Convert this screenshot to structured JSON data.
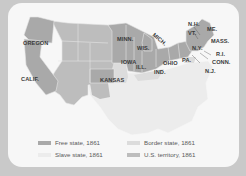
{
  "map": {
    "title": "United States, 1861",
    "labels": {
      "oregon": "OREGON",
      "calif": "CALIF.",
      "kansas": "KANSAS",
      "minn": "MINN.",
      "wis": "WIS.",
      "mich": "MICH.",
      "iowa": "IOWA",
      "ill": "ILL.",
      "ind": "IND.",
      "ohio": "OHIO",
      "pa": "PA.",
      "ny": "N.Y.",
      "nh": "N.H.",
      "vt": "VT.",
      "me": "ME.",
      "mass": "MASS.",
      "ri": "R.I.",
      "conn": "CONN.",
      "nj": "N.J."
    },
    "colors": {
      "background": "#c9c9c9",
      "card": "#f7f7f7",
      "free_state": "#a9a9a9",
      "slave_state": "#ececec",
      "border_state": "#dcdcdc",
      "us_territory": "#bdbdbd",
      "borders": "#e6e6e6"
    }
  },
  "legend": {
    "items": [
      {
        "label": "Free state, 1861",
        "color": "#a9a9a9"
      },
      {
        "label": "Slave state, 1861",
        "color": "#ececec"
      },
      {
        "label": "Border state, 1861",
        "color": "#dcdcdc"
      },
      {
        "label": "U.S. territory, 1861",
        "color": "#bdbdbd"
      }
    ]
  }
}
